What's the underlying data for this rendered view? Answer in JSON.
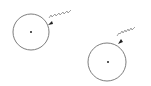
{
  "colors": {
    "background": "#ffffff",
    "circle_stroke": "#6e6e6e",
    "wave_stroke": "#8a8a8a",
    "arrow_fill": "#222222",
    "dot_fill": "#222222"
  },
  "diagram": {
    "elements": [
      {
        "id": "atom-1",
        "circle": {
          "cx": 31,
          "cy": 32,
          "r": 18
        },
        "nucleus": {
          "cx": 31,
          "cy": 32,
          "r": 1
        },
        "wave": {
          "from": [
            71,
            10
          ],
          "to": [
            51,
            23
          ]
        },
        "arrow_tip": [
          48,
          25
        ]
      },
      {
        "id": "atom-2",
        "circle": {
          "cx": 107,
          "cy": 62,
          "r": 19
        },
        "nucleus": {
          "cx": 108,
          "cy": 62,
          "r": 1
        },
        "wave": {
          "from": [
            135,
            27
          ],
          "to": [
            121,
            41
          ]
        },
        "arrow_tip": [
          118,
          44
        ]
      }
    ]
  }
}
